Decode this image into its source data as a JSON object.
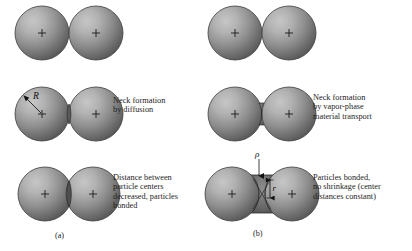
{
  "figure": {
    "background_color": "#ffffff",
    "sphere_fill_light": "#b9b9b9",
    "sphere_fill_dark": "#5d5d5d",
    "sphere_rim_color": "#3a3a3a",
    "neck_color": "#4a4a4a",
    "text_color": "#1d1d1d"
  },
  "columns": [
    {
      "id": "a",
      "panel_label": "(a)",
      "mechanism": "solid-state diffusion with shrinkage",
      "rows": [
        {
          "id": "a1",
          "stage": "initial-contact",
          "caption": "",
          "annotations": []
        },
        {
          "id": "a2",
          "stage": "neck-formation",
          "caption": "Neck formation\nby diffusion",
          "annotations": [
            {
              "symbol": "R",
              "meaning": "particle radius",
              "style": "italic"
            }
          ]
        },
        {
          "id": "a3",
          "stage": "bonded-shrinkage",
          "caption": "Distance between\nparticle centers\ndecreased, particles\nbonded",
          "annotations": []
        }
      ]
    },
    {
      "id": "b",
      "panel_label": "(b)",
      "mechanism": "vapor-phase material transport without shrinkage",
      "rows": [
        {
          "id": "b1",
          "stage": "initial-contact",
          "caption": "",
          "annotations": []
        },
        {
          "id": "b2",
          "stage": "neck-formation",
          "caption": "Neck formation\nby vapor-phase\nmaterial transport",
          "annotations": []
        },
        {
          "id": "b3",
          "stage": "bonded-no-shrinkage",
          "caption": "Particles bonded,\nno shrinkage (center\ndistances constant)",
          "annotations": [
            {
              "symbol": "ρ",
              "meaning": "neck surface radius of curvature",
              "style": "italic"
            },
            {
              "symbol": "r",
              "meaning": "neck radius",
              "style": "italic"
            }
          ]
        }
      ]
    }
  ],
  "symbols": {
    "radius": "R",
    "rho": "ρ",
    "neck_radius": "r",
    "center_mark": "+"
  }
}
